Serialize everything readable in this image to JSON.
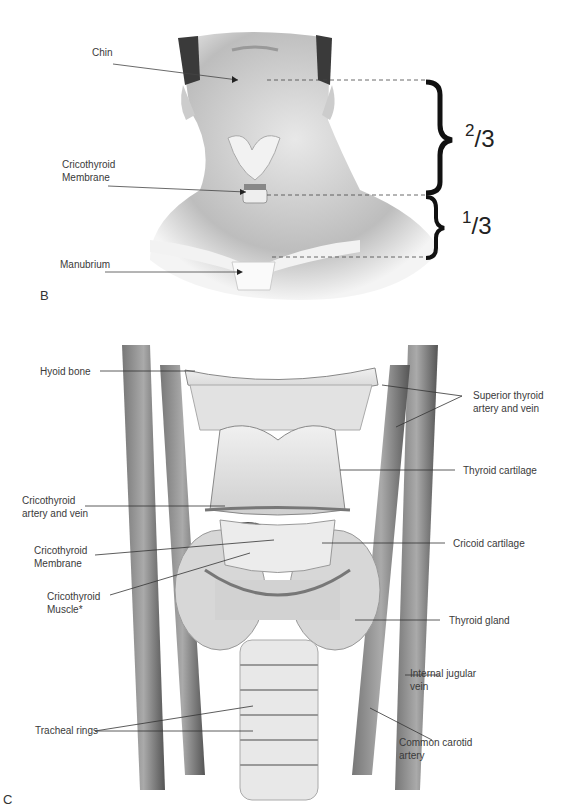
{
  "panel_b": {
    "letter": "B",
    "labels": {
      "chin": "Chin",
      "cricothyroid_membrane_line1": "Cricothyroid",
      "cricothyroid_membrane_line2": "Membrane",
      "manubrium": "Manubrium"
    },
    "proportions": {
      "upper": {
        "numerator": "2",
        "denominator": "3"
      },
      "lower": {
        "numerator": "1",
        "denominator": "3"
      }
    }
  },
  "panel_c": {
    "letter": "C",
    "labels": {
      "hyoid_bone": "Hyoid bone",
      "superior_thyroid_line1": "Superior thyroid",
      "superior_thyroid_line2": "artery and vein",
      "thyroid_cartilage": "Thyroid cartilage",
      "cricothyroid_artery_line1": "Cricothyroid",
      "cricothyroid_artery_line2": "artery and vein",
      "cricothyroid_membrane_line1": "Cricothyroid",
      "cricothyroid_membrane_line2": "Membrane",
      "cricoid_cartilage": "Cricoid cartilage",
      "cricothyroid_muscle_line1": "Cricothyroid",
      "cricothyroid_muscle_line2": "Muscle*",
      "thyroid_gland": "Thyroid gland",
      "internal_jugular_line1": "Internal jugular",
      "internal_jugular_line2": "vein",
      "tracheal_rings": "Tracheal rings",
      "common_carotid_line1": "Common carotid",
      "common_carotid_line2": "artery"
    }
  }
}
